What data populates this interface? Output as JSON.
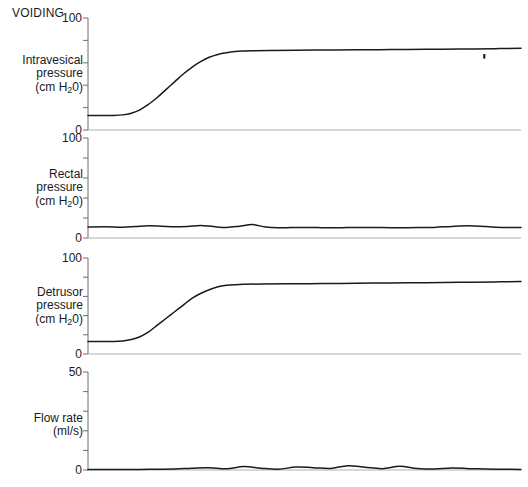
{
  "figure": {
    "title": "VOIDING",
    "background": "#ffffff",
    "trace_color": "#1a1a1a",
    "axis_color": "#6e6e6e",
    "baseline_color": "#b0b0b0",
    "width": 528,
    "height": 487
  },
  "chart_data": {
    "type": "line",
    "title": "VOIDING",
    "xlabel": "",
    "grid": false,
    "legend": "none",
    "shared_x": true,
    "x_axis_visible": false,
    "panels": [
      {
        "name": "intravesical-pressure",
        "label_lines": [
          "Intravesical",
          "pressure",
          "(cm H20)"
        ],
        "ylabel": "Intravesical pressure (cm H20)",
        "unit": "cm H20",
        "ylim": [
          0,
          100
        ],
        "yticks": [
          0,
          20,
          40,
          60,
          80,
          100
        ],
        "ytick_labels": [
          "0",
          "",
          "",
          "",
          "",
          "100"
        ],
        "baseline_value": 13,
        "plateau_value": 72,
        "rise_start_x": 0.09,
        "rise_end_x": 0.33,
        "series": [
          {
            "name": "intravesical pressure",
            "x": [
              0.0,
              0.03,
              0.06,
              0.08,
              0.1,
              0.12,
              0.14,
              0.16,
              0.18,
              0.2,
              0.22,
              0.24,
              0.26,
              0.28,
              0.3,
              0.32,
              0.34,
              0.36,
              0.38,
              0.42,
              0.48,
              0.55,
              0.62,
              0.7,
              0.78,
              0.86,
              0.94,
              1.0
            ],
            "values": [
              13,
              13,
              13,
              13.5,
              15,
              18,
              23,
              29,
              36,
              43,
              50,
              56,
              61,
              65,
              67.5,
              69,
              70,
              70.5,
              70.8,
              71,
              71.2,
              71.4,
              71.6,
              71.8,
              72,
              72.3,
              72.6,
              73
            ]
          }
        ],
        "annotations": [
          {
            "name": "artifact-mark",
            "x": 0.915,
            "y": 66,
            "kind": "tick"
          }
        ]
      },
      {
        "name": "rectal-pressure",
        "label_lines": [
          "Rectal",
          "pressure",
          "(cm H20)"
        ],
        "ylabel": "Rectal pressure (cm H20)",
        "unit": "cm H20",
        "ylim": [
          0,
          100
        ],
        "yticks": [
          0,
          20,
          40,
          60,
          80,
          100
        ],
        "ytick_labels": [
          "0",
          "",
          "",
          "",
          "",
          "100"
        ],
        "baseline_value": 11,
        "plateau_value": 11,
        "series": [
          {
            "name": "rectal pressure",
            "x": [
              0.0,
              0.04,
              0.08,
              0.11,
              0.14,
              0.17,
              0.2,
              0.23,
              0.26,
              0.29,
              0.32,
              0.35,
              0.38,
              0.41,
              0.44,
              0.47,
              0.5,
              0.53,
              0.56,
              0.6,
              0.64,
              0.68,
              0.72,
              0.76,
              0.8,
              0.84,
              0.88,
              0.92,
              0.96,
              1.0
            ],
            "values": [
              11,
              11.2,
              10.8,
              11.5,
              12.2,
              11.8,
              11.2,
              11.6,
              12.6,
              11.4,
              10.6,
              11.8,
              13.4,
              11.0,
              10.2,
              10.4,
              10.5,
              10.4,
              10.3,
              10.4,
              10.5,
              10.4,
              10.3,
              10.4,
              10.6,
              11.6,
              12.2,
              11.4,
              10.6,
              10.4
            ]
          }
        ]
      },
      {
        "name": "detrusor-pressure",
        "label_lines": [
          "Detrusor",
          "pressure",
          "(cm H20)"
        ],
        "ylabel": "Detrusor pressure (cm H20)",
        "unit": "cm H20",
        "ylim": [
          0,
          100
        ],
        "yticks": [
          0,
          20,
          40,
          60,
          80,
          100
        ],
        "ytick_labels": [
          "0",
          "",
          "",
          "",
          "",
          "100"
        ],
        "baseline_value": 13,
        "plateau_value": 74,
        "rise_start_x": 0.09,
        "rise_end_x": 0.34,
        "series": [
          {
            "name": "detrusor pressure",
            "x": [
              0.0,
              0.03,
              0.06,
              0.08,
              0.1,
              0.12,
              0.14,
              0.16,
              0.18,
              0.2,
              0.22,
              0.24,
              0.26,
              0.28,
              0.3,
              0.32,
              0.34,
              0.36,
              0.4,
              0.46,
              0.54,
              0.62,
              0.7,
              0.78,
              0.86,
              0.94,
              1.0
            ],
            "values": [
              13,
              13,
              13,
              13.5,
              15,
              18,
              23,
              30,
              37,
              44,
              51,
              58,
              63,
              67,
              70,
              71.5,
              72.2,
              72.6,
              72.9,
              73.1,
              73.4,
              73.7,
              74,
              74.3,
              74.7,
              75.1,
              75.5
            ]
          }
        ]
      },
      {
        "name": "flow-rate",
        "label_lines": [
          "Flow rate",
          "(ml/s)"
        ],
        "ylabel": "Flow rate (ml/s)",
        "unit": "ml/s",
        "ylim": [
          0,
          50
        ],
        "yticks": [
          0,
          10,
          20,
          30,
          40,
          50
        ],
        "ytick_labels": [
          "0",
          "",
          "",
          "",
          "",
          "50"
        ],
        "baseline_value": 0,
        "plateau_value": 0,
        "series": [
          {
            "name": "flow rate",
            "x": [
              0.0,
              0.04,
              0.08,
              0.12,
              0.16,
              0.2,
              0.24,
              0.28,
              0.32,
              0.36,
              0.4,
              0.44,
              0.48,
              0.52,
              0.56,
              0.6,
              0.64,
              0.68,
              0.72,
              0.76,
              0.8,
              0.84,
              0.88,
              0.92,
              0.96,
              1.0
            ],
            "values": [
              0.2,
              0.3,
              0.2,
              0.3,
              0.4,
              0.5,
              0.9,
              1.2,
              0.6,
              1.8,
              0.9,
              0.4,
              1.5,
              1.2,
              0.8,
              2.2,
              1.4,
              0.7,
              1.9,
              0.8,
              0.5,
              1.0,
              0.7,
              0.5,
              0.4,
              0.3
            ]
          }
        ]
      }
    ]
  }
}
